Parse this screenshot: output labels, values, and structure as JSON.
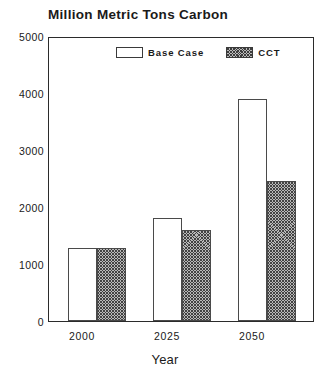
{
  "chart_data": {
    "type": "bar",
    "title": "Million Metric Tons Carbon",
    "xlabel": "Year",
    "ylabel": "",
    "categories": [
      "2000",
      "2025",
      "2050"
    ],
    "series": [
      {
        "name": "Base Case",
        "values": [
          1280,
          1800,
          3900
        ],
        "fill": "white",
        "swatch": "legend-swatch-base"
      },
      {
        "name": "CCT",
        "values": [
          1280,
          1600,
          2450
        ],
        "fill": "hatched-gray",
        "swatch": "legend-swatch-cct"
      }
    ],
    "ylim": [
      0,
      5000
    ],
    "yticks": [
      0,
      1000,
      2000,
      3000,
      4000,
      5000
    ],
    "ytick_labels": [
      "0",
      "1000",
      "2000",
      "3000",
      "4000",
      "5000"
    ],
    "xtick_labels": [
      "2000",
      "2025",
      "2050"
    ],
    "grid": false,
    "legend_position": "upper center inside",
    "frame": true,
    "colors": {
      "axis": "#2b2b2b",
      "text": "#1a1a1a",
      "base_fill": "#ffffff",
      "cct_fill": "#b9b9b9",
      "bar_edge": "#4a4a4a"
    }
  }
}
